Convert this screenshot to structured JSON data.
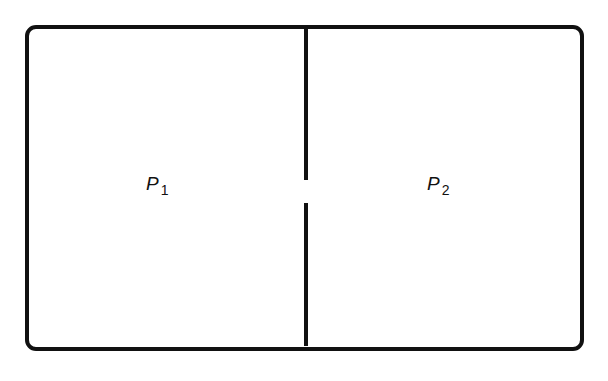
{
  "diagram": {
    "type": "partitioned-container",
    "container": {
      "shape": "rounded-rectangle",
      "stroke_color": "#111111",
      "fill_color": "#ffffff"
    },
    "partition": {
      "orientation": "vertical",
      "has_opening": true,
      "opening_position": "middle"
    },
    "regions": [
      {
        "id": "left",
        "label_main": "P",
        "label_sub": "1"
      },
      {
        "id": "right",
        "label_main": "P",
        "label_sub": "2"
      }
    ]
  }
}
